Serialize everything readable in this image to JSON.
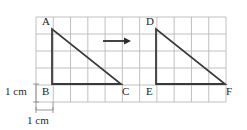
{
  "figure": {
    "background_color": "#ffffff",
    "width": 247,
    "height": 130
  },
  "grid": {
    "line_color": "#b9b9b9",
    "cell_size_px": 17.3,
    "columns": 11,
    "rows": 5,
    "left": 36,
    "top": 17,
    "right": 226,
    "bottom": 102
  },
  "shapes": {
    "stroke_color": "#3a3a3a",
    "triangle_1": {
      "name": "triangle-abc",
      "vertices": [
        {
          "label": "A",
          "x": 52,
          "y": 29
        },
        {
          "label": "B",
          "x": 52,
          "y": 84
        },
        {
          "label": "C",
          "x": 121,
          "y": 84
        }
      ]
    },
    "triangle_2": {
      "name": "triangle-def",
      "vertices": [
        {
          "label": "D",
          "x": 156,
          "y": 29
        },
        {
          "label": "E",
          "x": 156,
          "y": 84
        },
        {
          "label": "F",
          "x": 225,
          "y": 84
        }
      ]
    }
  },
  "arrow": {
    "name": "translation-arrow",
    "x_start": 103,
    "x_end": 131,
    "y": 41,
    "color": "#2e2e2e"
  },
  "vertex_labels": {
    "a": "A",
    "b": "B",
    "c": "C",
    "d": "D",
    "e": "E",
    "f": "F"
  },
  "scale_labels": {
    "vertical": "1 cm",
    "horizontal": "1 cm"
  },
  "tick_marks": {
    "color": "#8a8a8a",
    "vertical_tick": {
      "x": 36,
      "y_top": 84,
      "y_bottom": 102
    },
    "horizontal_tick": {
      "y": 110,
      "x_left": 36,
      "x_right": 53
    }
  }
}
